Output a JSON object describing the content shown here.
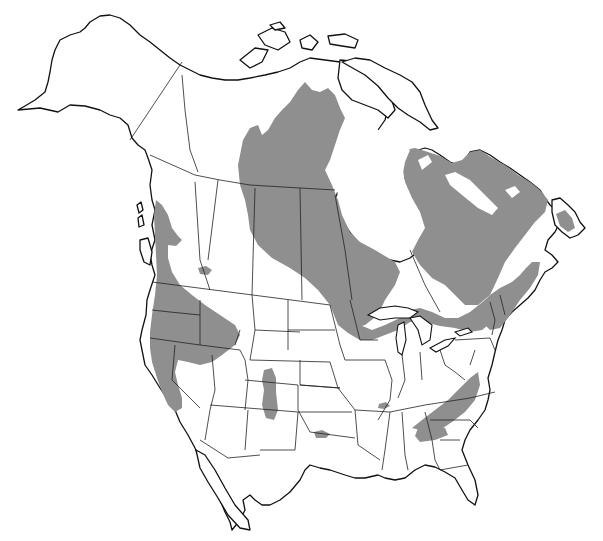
{
  "map": {
    "type": "species-range-map",
    "region": "North America",
    "background_color": "#ffffff",
    "range_color": "#8f8f8f",
    "outline_color": "#111111",
    "labels": [],
    "range_areas": [
      "Northern Canada (Nunavut / NWT central region)",
      "Quebec and Labrador",
      "Pacific Northwest coast (BC, Washington, Oregon)",
      "Idaho and northern Nevada",
      "California Sierra Nevada",
      "Colorado Rockies",
      "Great Lakes region (Minnesota, Wisconsin, Ontario)",
      "New England and Maritimes",
      "Newfoundland",
      "Southern Appalachians",
      "Ozarks (Missouri)",
      "Oklahoma/Texas border"
    ]
  }
}
